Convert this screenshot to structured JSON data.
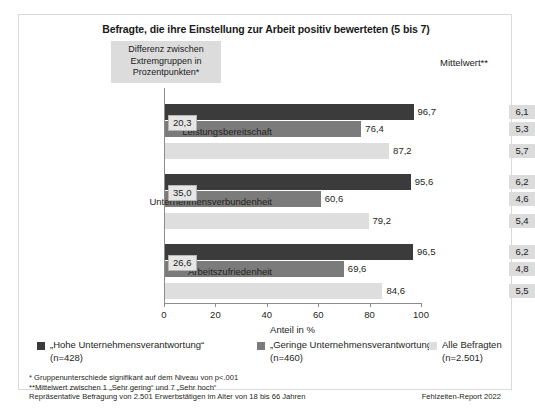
{
  "chart_data": {
    "type": "bar",
    "orientation": "horizontal",
    "title": "Befragte, die ihre Einstellung zur Arbeit positiv bewerteten (5 bis 7)",
    "xlabel": "Anteil in %",
    "ylabel": "",
    "xlim": [
      0,
      100
    ],
    "xticks": [
      0,
      20,
      40,
      60,
      80,
      100
    ],
    "xticklabels": [
      "0",
      "20",
      "40",
      "60",
      "80",
      "100"
    ],
    "grid": false,
    "legend_position": "bottom",
    "categories": [
      "Leistungsbereitschaft",
      "Unternehmensverbundenheit",
      "Arbeitszufriedenheit"
    ],
    "series": [
      {
        "name": "„Hohe Unternehmensverantwortung“",
        "n_label": "(n=428)",
        "color": "#3b3b3b",
        "values": [
          96.7,
          95.6,
          96.5
        ],
        "value_labels": [
          "96,7",
          "95,6",
          "96,5"
        ]
      },
      {
        "name": "„Geringe Unternehmensverantwortung“",
        "n_label": "(n=460)",
        "color": "#7b7b7b",
        "values": [
          76.4,
          60.6,
          69.6
        ],
        "value_labels": [
          "76,4",
          "60,6",
          "69,6"
        ]
      },
      {
        "name": "Alle Befragten",
        "n_label": "(n=2.501)",
        "color": "#dedede",
        "values": [
          87.2,
          79.2,
          84.6
        ],
        "value_labels": [
          "87,2",
          "79,2",
          "84,6"
        ]
      }
    ],
    "annotations": {
      "difference_header": "Differenz zwischen Extremgruppen in Prozentpunkten*",
      "difference_values": [
        20.3,
        35.0,
        26.6
      ],
      "difference_labels": [
        "20,3",
        "35,0",
        "26,6"
      ],
      "mean_header": "Mittelwert**",
      "mean_values": [
        [
          6.1,
          5.3,
          5.7
        ],
        [
          6.2,
          4.6,
          5.4
        ],
        [
          6.2,
          4.8,
          5.5
        ]
      ],
      "mean_labels": [
        [
          "6,1",
          "5,3",
          "5,7"
        ],
        [
          "6,2",
          "4,6",
          "5,4"
        ],
        [
          "6,2",
          "4,8",
          "5,5"
        ]
      ]
    }
  },
  "header": {
    "title": "Befragte, die ihre Einstellung zur Arbeit positiv bewerteten (5 bis 7)",
    "difference_box": "Differenz zwischen Extremgruppen in Prozentpunkten*",
    "mean_label": "Mittelwert**"
  },
  "axis": {
    "xlabel": "Anteil in %",
    "ticks": [
      "0",
      "20",
      "40",
      "60",
      "80",
      "100"
    ]
  },
  "categories": [
    {
      "label": "Leistungsbereitschaft"
    },
    {
      "label": "Unternehmensverbundenheit"
    },
    {
      "label": "Arbeitszufriedenheit"
    }
  ],
  "legend": [
    {
      "label": "„Hohe Unternehmensverantwortung“",
      "n": "(n=428)",
      "color": "#3b3b3b"
    },
    {
      "label": "„Geringe Unternehmensverantwortung“",
      "n": "(n=460)",
      "color": "#7b7b7b"
    },
    {
      "label": "Alle Befragten",
      "n": "(n=2.501)",
      "color": "#dedede"
    }
  ],
  "footnotes": {
    "line1": "*  Gruppenunterschiede signifikant auf dem Niveau von p<.001",
    "line2": "**Mittelwert zwischen 1 „Sehr gering“ und 7 „Sehr hoch“",
    "line3": "Repräsentative Befragung von 2.501 Erwerbstätigen im Alter von 18 bis 66 Jahren",
    "source": "Fehlzeiten-Report 2022"
  }
}
